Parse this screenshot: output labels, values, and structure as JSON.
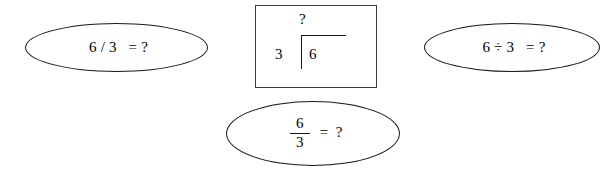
{
  "diagram": {
    "background_color": "#ffffff",
    "stroke_color": "#1a1a1a"
  },
  "nodes": {
    "slash_ellipse": {
      "shape": "ellipse",
      "text": "6 / 3   = ?"
    },
    "obelus_ellipse": {
      "shape": "ellipse",
      "text": "6 ÷ 3   = ?"
    },
    "fraction_ellipse": {
      "shape": "ellipse",
      "numerator": "6",
      "denominator": "3",
      "equals": "=  ?"
    },
    "long_division_box": {
      "shape": "rectangle",
      "quotient": "?",
      "divisor": "3",
      "dividend": "6"
    }
  }
}
